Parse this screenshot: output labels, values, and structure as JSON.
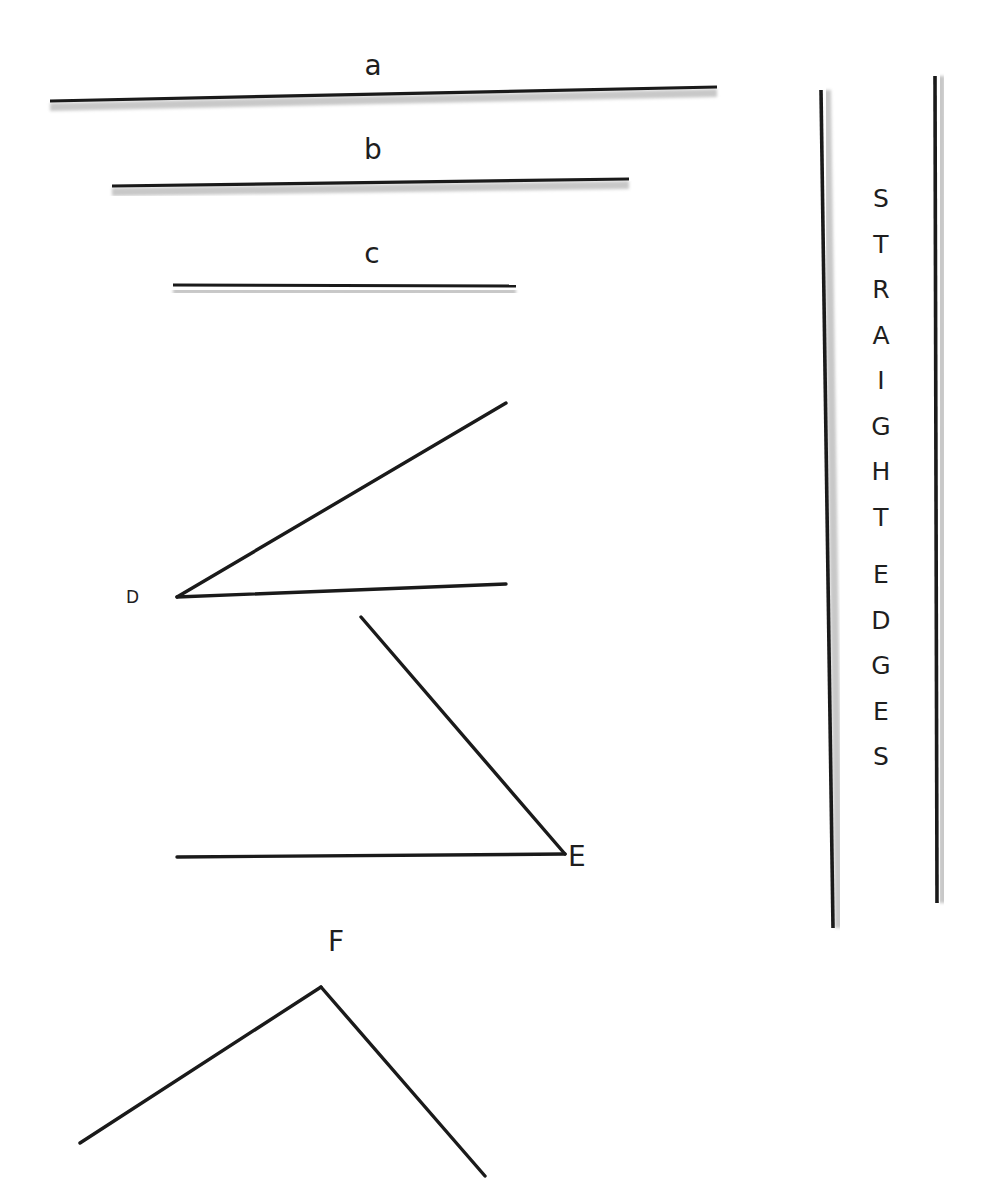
{
  "colors": {
    "line": "#1a1a1a",
    "shadow": "#c8c8c8",
    "text": "#1e1e1e",
    "background": "#ffffff"
  },
  "segments": [
    {
      "label": "a",
      "x1": 50,
      "y1": 101,
      "x2": 717,
      "y2": 87,
      "label_x": 373,
      "label_y": 52
    },
    {
      "label": "b",
      "x1": 112,
      "y1": 186,
      "x2": 629,
      "y2": 179,
      "label_x": 373,
      "label_y": 136
    },
    {
      "label": "c",
      "x1": 173,
      "y1": 285,
      "x2": 516,
      "y2": 286,
      "label_x": 372,
      "label_y": 240
    }
  ],
  "angles": [
    {
      "label": "D",
      "vertex": [
        177,
        597
      ],
      "ray1_end": [
        506,
        403
      ],
      "ray2_end": [
        506,
        584
      ],
      "label_x": 126,
      "label_y": 589
    },
    {
      "label": "E",
      "vertex": [
        565,
        854
      ],
      "ray1_end": [
        361,
        617
      ],
      "ray2_end": [
        177,
        857
      ],
      "label_x": 568,
      "label_y": 843
    },
    {
      "label": "F",
      "vertex": [
        321,
        987
      ],
      "ray1_end": [
        80,
        1143
      ],
      "ray2_end": [
        485,
        1176
      ],
      "label_x": 336,
      "label_y": 928
    }
  ],
  "straight_edges": {
    "left": {
      "x1": 821,
      "y1": 90,
      "x2": 833,
      "y2": 928
    },
    "right": {
      "x1": 935,
      "y1": 76,
      "x2": 937,
      "y2": 903
    },
    "word1": [
      "S",
      "T",
      "R",
      "A",
      "I",
      "G",
      "H",
      "T"
    ],
    "word2": [
      "E",
      "D",
      "G",
      "E",
      "S"
    ],
    "text": "STRAIGHT EDGES"
  }
}
